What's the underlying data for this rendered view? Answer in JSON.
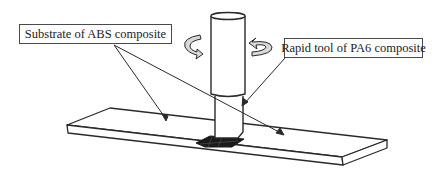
{
  "figure": {
    "type": "friction stir welding schematic",
    "labels": {
      "substrate": "Substrate of ABS composite",
      "tool": "Rapid tool of PA6 composite"
    },
    "components": [
      {
        "name": "substrate-plate",
        "description": "flat rectangular plate in perspective"
      },
      {
        "name": "rapid-tool",
        "description": "vertical cylindrical tool with shoulder and pin"
      },
      {
        "name": "rotation-arrows",
        "description": "two curved arrows indicating tool rotation"
      },
      {
        "name": "weld-zone",
        "description": "dark hatched contact area at tool base"
      }
    ],
    "colors": {
      "line": "#2a2a2a",
      "arrow_fill": "#d9d9d9",
      "weld_zone": "#1a1a1a",
      "background": "#ffffff"
    }
  }
}
